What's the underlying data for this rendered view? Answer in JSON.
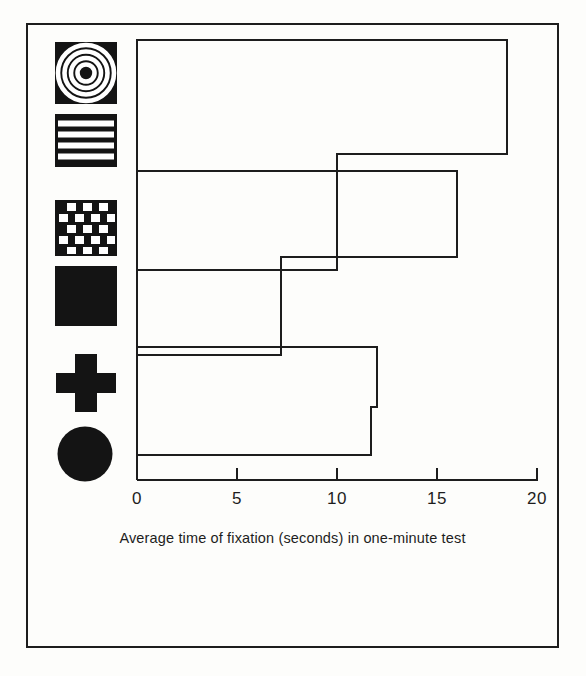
{
  "figure": {
    "caption": "Average time of fixation (seconds) in one-minute test",
    "ink_color": "#1d1d1d",
    "paper_color": "#fdfdfb"
  },
  "chart_data": {
    "type": "bar",
    "orientation": "horizontal",
    "title": "",
    "xlabel": "Average time of fixation (seconds) in one-minute test",
    "ylabel": "",
    "xlim": [
      0,
      20
    ],
    "grid": false,
    "legend": false,
    "tick_labels": [
      "0",
      "5",
      "10",
      "15",
      "20"
    ],
    "tick_values": [
      0,
      5,
      10,
      15,
      20
    ],
    "categories": [
      "bullseye",
      "horizontal-stripes",
      "checkerboard",
      "solid-black-square",
      "black-cross",
      "black-circle"
    ],
    "category_icons": [
      "bullseye-icon",
      "stripes-icon",
      "checkerboard-icon",
      "solid-square-icon",
      "cross-icon",
      "circle-icon"
    ],
    "values": [
      18.5,
      10.0,
      16.0,
      7.2,
      12.0,
      11.7
    ]
  },
  "ticks": [
    {
      "label": "0",
      "value": 0
    },
    {
      "label": "5",
      "value": 5
    },
    {
      "label": "10",
      "value": 10
    },
    {
      "label": "15",
      "value": 15
    },
    {
      "label": "20",
      "value": 20
    }
  ],
  "bars": [
    {
      "name": "bullseye",
      "value": 18.5
    },
    {
      "name": "horizontal-stripes",
      "value": 10.0
    },
    {
      "name": "checkerboard",
      "value": 16.0
    },
    {
      "name": "solid-black-square",
      "value": 7.2
    },
    {
      "name": "black-cross",
      "value": 12.0
    },
    {
      "name": "black-circle",
      "value": 11.7
    }
  ]
}
